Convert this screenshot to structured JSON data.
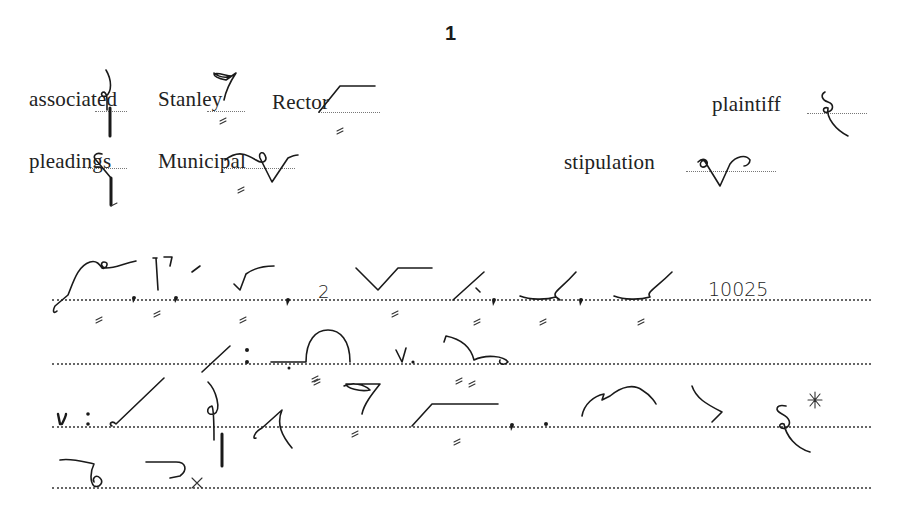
{
  "page": {
    "number": "1"
  },
  "vocabulary": [
    {
      "word": "associated",
      "outline": "associated-outline"
    },
    {
      "word": "Stanley",
      "outline": "stanley-outline"
    },
    {
      "word": "Rector",
      "outline": "rector-outline"
    },
    {
      "word": "plaintiff",
      "outline": "plaintiff-outline"
    },
    {
      "word": "pleadings",
      "outline": "pleadings-outline"
    },
    {
      "word": "Municipal",
      "outline": "municipal-outline"
    },
    {
      "word": "stipulation",
      "outline": "stipulation-outline"
    }
  ],
  "passage": {
    "line1": {
      "number": "10025",
      "punctuation": [
        ",",
        ",",
        ",",
        ",",
        ","
      ],
      "numeral": "2"
    },
    "line2": {
      "symbols": [
        ":",
        "v."
      ]
    },
    "line3": {
      "symbols": [
        ":",
        ",",
        ".",
        "*"
      ]
    },
    "line4": {
      "symbols": [
        "x"
      ]
    }
  },
  "colors": {
    "ink": "#1a1a1a",
    "background": "#ffffff",
    "ruling": "#666666"
  }
}
